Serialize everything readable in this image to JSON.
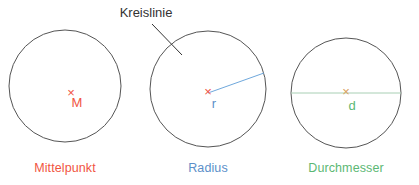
{
  "figure": {
    "title_annotation": {
      "label": "Kreislinie",
      "color": "#333333",
      "x": 146,
      "y": 17,
      "leader": {
        "x1": 152,
        "y1": 24,
        "x2": 182,
        "y2": 55
      }
    },
    "background": "#ffffff",
    "outline_color": "#555555",
    "circles": [
      {
        "id": "mittelpunkt",
        "caption": "Mittelpunkt",
        "caption_color": "#F1543F",
        "caption_x": 65,
        "caption_y": 172,
        "cx": 65,
        "cy": 86,
        "r": 56,
        "center_mark": {
          "symbol": "×",
          "x": 71,
          "y": 94,
          "color": "#F1543F"
        },
        "mark_label": {
          "text": "M",
          "x": 77,
          "y": 107,
          "color": "#F1543F"
        },
        "measure_line": null
      },
      {
        "id": "radius",
        "caption": "Radius",
        "caption_color": "#5B8FC9",
        "caption_x": 208,
        "caption_y": 172,
        "cx": 208,
        "cy": 89,
        "r": 58,
        "center_mark": {
          "symbol": "×",
          "x": 208,
          "y": 93,
          "color": "#F1543F"
        },
        "mark_label": {
          "text": "r",
          "x": 214,
          "y": 108,
          "color": "#5B8FC9"
        },
        "measure_line": {
          "kind": "radius",
          "color": "#6FA8DC",
          "x1": 208,
          "y1": 93,
          "x2": 264,
          "y2": 73
        }
      },
      {
        "id": "durchmesser",
        "caption": "Durchmesser",
        "caption_color": "#5CB874",
        "caption_x": 346,
        "caption_y": 172,
        "cx": 346,
        "cy": 93,
        "r": 55,
        "center_mark": {
          "symbol": "×",
          "x": 346,
          "y": 93,
          "color": "#D9A05B"
        },
        "mark_label": {
          "text": "d",
          "x": 352,
          "y": 110,
          "color": "#5CB874"
        },
        "measure_line": {
          "kind": "diameter",
          "color": "#A8CFB4",
          "x1": 291,
          "y1": 93,
          "x2": 401,
          "y2": 93
        }
      }
    ]
  },
  "chart_data": {
    "type": "diagram",
    "title": "Kreislinie",
    "subtitle": "",
    "xlabel": "",
    "ylabel": "",
    "categories": [
      "Mittelpunkt",
      "Radius",
      "Durchmesser"
    ],
    "annotations": [
      "Kreislinie",
      "M",
      "r",
      "d"
    ],
    "series": [
      {
        "name": "Kreis 1 – Mittelpunkt",
        "center": [
          65,
          86
        ],
        "radius": 56,
        "marker": "M",
        "color": "#F1543F"
      },
      {
        "name": "Kreis 2 – Radius",
        "center": [
          208,
          89
        ],
        "radius": 58,
        "marker": "r",
        "color": "#5B8FC9"
      },
      {
        "name": "Kreis 3 – Durchmesser",
        "center": [
          346,
          93
        ],
        "radius": 55,
        "marker": "d",
        "color": "#5CB874"
      }
    ],
    "legend_position": "below-each-figure",
    "grid": false
  }
}
